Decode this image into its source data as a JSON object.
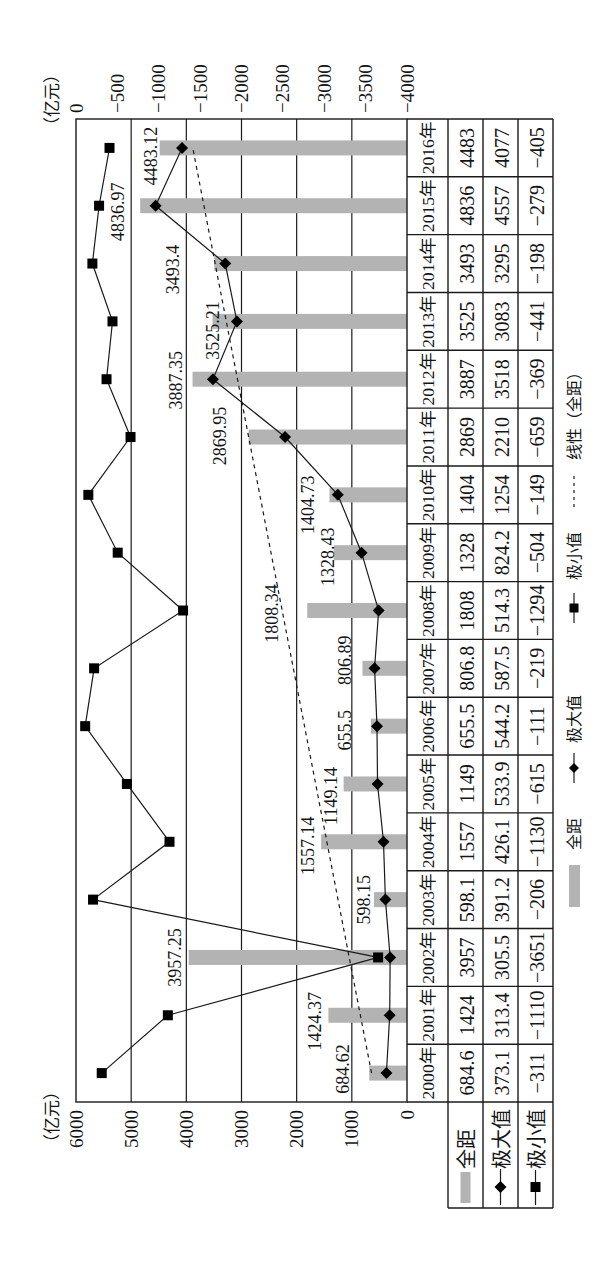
{
  "chart_data": {
    "type": "bar",
    "subtype": "combo bar + line chart with data table",
    "title": "",
    "xlabel": "",
    "ylabel": "（亿元）",
    "y2label": "（亿元）",
    "categories": [
      "2000年",
      "2001年",
      "2002年",
      "2003年",
      "2004年",
      "2005年",
      "2006年",
      "2007年",
      "2008年",
      "2009年",
      "2010年",
      "2011年",
      "2012年",
      "2013年",
      "2014年",
      "2015年",
      "2016年"
    ],
    "series": [
      {
        "name": "全距",
        "type": "bar",
        "axis": "primary",
        "color": "#b3b3b3",
        "values": [
          684.62,
          1424.37,
          3957.25,
          598.15,
          1557.14,
          1149.14,
          655.5,
          806.89,
          1808.34,
          1328.43,
          1404.73,
          2869.95,
          3887.35,
          3525.21,
          3493.4,
          4836.97,
          4483.12
        ],
        "data_labels": [
          "684.62",
          "1424.37",
          "3957.25",
          "598.15",
          "1557.14",
          "1149.14",
          "655.5",
          "806.89",
          "1808.34",
          "1328.43",
          "1404.73",
          "2869.95",
          "3887.35",
          "3525.21",
          "3493.4",
          "4836.97",
          "4483.12"
        ]
      },
      {
        "name": "极大值",
        "type": "line",
        "marker": "diamond",
        "axis": "primary",
        "color": "#000000",
        "values": [
          373.1,
          313.4,
          305.5,
          391.2,
          426.1,
          533.9,
          544.2,
          587.5,
          514.3,
          824.2,
          1254,
          2210,
          3518,
          3083,
          3295,
          4557,
          4077
        ]
      },
      {
        "name": "极小值",
        "type": "line",
        "marker": "square",
        "axis": "secondary",
        "color": "#000000",
        "values": [
          -311,
          -1110,
          -3651,
          -206,
          -1130,
          -615,
          -111,
          -219,
          -1294,
          -504,
          -149,
          -659,
          -369,
          -441,
          -198,
          -279,
          -405
        ]
      },
      {
        "name": "线性（全距）",
        "type": "trendline",
        "style": "dashed",
        "source": "全距",
        "color": "#000000"
      }
    ],
    "ylim": [
      0,
      6000
    ],
    "yticks": [
      0,
      1000,
      2000,
      3000,
      4000,
      5000,
      6000
    ],
    "ytick_labels": [
      "0",
      "1000",
      "2000",
      "3000",
      "4000",
      "5000",
      "6000"
    ],
    "y2lim": [
      -4000,
      0
    ],
    "y2ticks": [
      0,
      -500,
      -1000,
      -1500,
      -2000,
      -2500,
      -3000,
      -3500,
      -4000
    ],
    "y2tick_labels": [
      "0",
      "−500",
      "−1000",
      "−1500",
      "−2000",
      "−2500",
      "−3000",
      "−3500",
      "−4000"
    ],
    "y2_inverted": true,
    "grid": true,
    "legend_position": "bottom",
    "legend": [
      "全距",
      "极大值",
      "极小值",
      "线性（全距）"
    ]
  },
  "data_table": {
    "rows": [
      {
        "label": "全距",
        "key": "bar",
        "cells": [
          "684.6",
          "1424",
          "3957",
          "598.1",
          "1557",
          "1149",
          "655.5",
          "806.8",
          "1808",
          "1328",
          "1404",
          "2869",
          "3887",
          "3525",
          "3493",
          "4836",
          "4483"
        ]
      },
      {
        "label": "极大值",
        "key": "diamond-line",
        "cells": [
          "373.1",
          "313.4",
          "305.5",
          "391.2",
          "426.1",
          "533.9",
          "544.2",
          "587.5",
          "514.3",
          "824.2",
          "1254",
          "2210",
          "3518",
          "3083",
          "3295",
          "4557",
          "4077"
        ]
      },
      {
        "label": "极小值",
        "key": "square-line",
        "cells": [
          "−311",
          "−1110",
          "−3651",
          "−206",
          "−1130",
          "−615",
          "−111",
          "−219",
          "−1294",
          "−504",
          "−149",
          "−659",
          "−369",
          "−441",
          "−198",
          "−279",
          "−405"
        ]
      }
    ]
  }
}
